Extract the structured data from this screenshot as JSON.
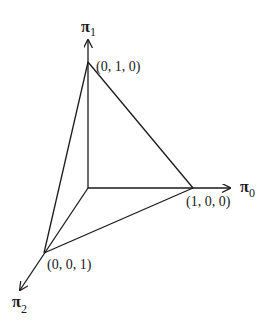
{
  "diagram": {
    "axes": [
      {
        "id": "pi0",
        "symbol": "π",
        "subscript": "0",
        "direction": "right"
      },
      {
        "id": "pi1",
        "symbol": "π",
        "subscript": "1",
        "direction": "up"
      },
      {
        "id": "pi2",
        "symbol": "π",
        "subscript": "2",
        "direction": "down-left"
      }
    ],
    "vertices": [
      {
        "id": "v010",
        "label": "(0, 1, 0)"
      },
      {
        "id": "v100",
        "label": "(1, 0, 0)"
      },
      {
        "id": "v001",
        "label": "(0, 0, 1)"
      }
    ],
    "edges": [
      [
        "origin",
        "v010"
      ],
      [
        "origin",
        "v100"
      ],
      [
        "origin",
        "v001"
      ],
      [
        "v010",
        "v100"
      ],
      [
        "v100",
        "v001"
      ],
      [
        "v001",
        "v010"
      ]
    ],
    "colors": {
      "stroke": "#1a1a1a",
      "background": "#ffffff"
    }
  }
}
